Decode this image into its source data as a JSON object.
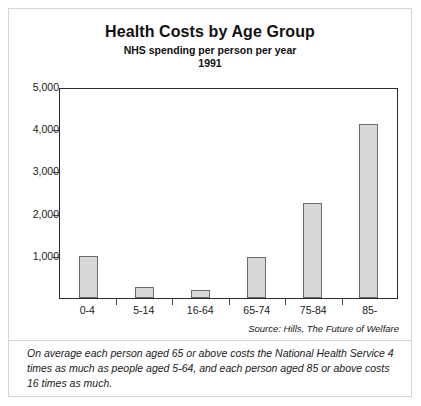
{
  "chart_data": {
    "type": "bar",
    "title": "Health Costs by Age Group",
    "subtitle": "NHS spending per person per year",
    "year": "1991",
    "xlabel": "",
    "ylabel": "",
    "categories": [
      "0-4",
      "5-14",
      "16-64",
      "65-74",
      "75-84",
      "85-"
    ],
    "values": [
      1000,
      250,
      200,
      980,
      2240,
      4120
    ],
    "ylim": [
      0,
      5000
    ],
    "yticks": [
      1000,
      2000,
      3000,
      4000,
      5000
    ],
    "ytick_labels": [
      "1,000",
      "2,000",
      "3,000",
      "4,000",
      "5,000"
    ],
    "grid": false,
    "legend": false,
    "bar_fill_color": "#d8d8d8",
    "bar_border_color": "#6b6b6b",
    "axis_color": "#2b2b2b",
    "source": "Source: Hills, The Future of Welfare",
    "annotation": "On average each person aged 65 or above costs the National Health Service 4 times as much as people aged 5-64, and each person aged 85 or above costs 16 times as much."
  }
}
